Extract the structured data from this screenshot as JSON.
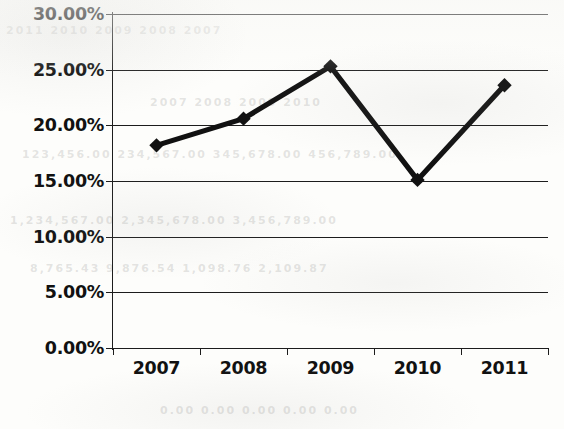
{
  "chart_data": {
    "type": "line",
    "title": "",
    "subtitle": "",
    "xlabel": "",
    "ylabel": "",
    "categories": [
      "2007",
      "2008",
      "2009",
      "2010",
      "2011"
    ],
    "values": [
      18.2,
      20.6,
      25.3,
      15.1,
      23.6
    ],
    "value_labels": [
      "18.20%",
      "20.60%",
      "25.30%",
      "15.10%",
      "23.60%"
    ],
    "series": [
      {
        "name": "",
        "values": [
          18.2,
          20.6,
          25.3,
          15.1,
          23.6
        ]
      }
    ],
    "ylim": [
      0,
      30
    ],
    "ytick_values": [
      0,
      5,
      10,
      15,
      20,
      25,
      30
    ],
    "ytick_labels": [
      "0.00%",
      "5.00%",
      "10.00%",
      "15.00%",
      "20.00%",
      "25.00%",
      "30.00%"
    ],
    "xtick_labels": [
      "2007",
      "2008",
      "2009",
      "2010",
      "2011"
    ],
    "grid": "horizontal",
    "legend": "none",
    "marker": "diamond",
    "line_color": "#111111",
    "marker_color": "#111111",
    "grid_color": "#1c1c1c",
    "background_color": "#fdfdfb",
    "text_color": "#111111"
  },
  "artifacts": {
    "ghost_rows": [
      "2011  2010  2009  2008  2007",
      "2007      2008      2009      2010",
      "123,456.00  234,567.00  345,678.00  456,789.00",
      "1,234,567.00  2,345,678.00  3,456,789.00",
      "8,765.43    9,876.54    1,098.76    2,109.87",
      "0.00    0.00    0.00    0.00    0.00"
    ]
  }
}
